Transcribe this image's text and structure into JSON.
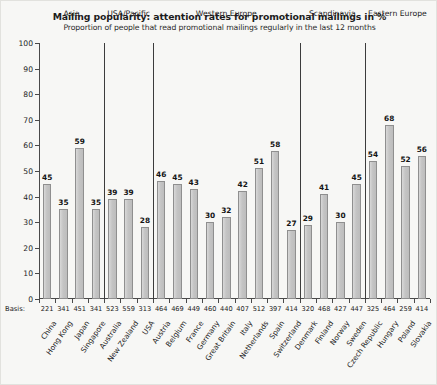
{
  "chart_data": {
    "type": "bar",
    "title": "Mailing popularity: attention rates for promotional mailings in %",
    "subtitle": "Proportion of people that read promotional mailings regularly in the last 12 months",
    "xlabel": "",
    "ylabel": "",
    "ylim": [
      0,
      100
    ],
    "yticks": [
      0,
      10,
      20,
      30,
      40,
      50,
      60,
      70,
      80,
      90,
      100
    ],
    "grid": false,
    "legend": "none",
    "basis_caption": "Basis:",
    "categories": [
      "China",
      "Hong Kong",
      "Japan",
      "Singapore",
      "Australia",
      "New Zealand",
      "USA",
      "Austria",
      "Belgium",
      "France",
      "Germany",
      "Great Britain",
      "Italy",
      "Netherlands",
      "Spain",
      "Switzerland",
      "Denmark",
      "Finland",
      "Norway",
      "Sweden",
      "Czech Republic",
      "Hungary",
      "Poland",
      "Slovakia"
    ],
    "values": [
      45,
      35,
      59,
      35,
      39,
      39,
      28,
      46,
      45,
      43,
      30,
      32,
      42,
      51,
      58,
      27,
      29,
      41,
      30,
      45,
      54,
      68,
      52,
      56
    ],
    "basis": [
      221,
      341,
      451,
      341,
      523,
      559,
      313,
      464,
      469,
      449,
      460,
      440,
      407,
      512,
      397,
      414,
      320,
      468,
      427,
      447,
      325,
      464,
      259,
      414
    ],
    "groups": [
      {
        "label": "Asia",
        "start": 0,
        "end": 3
      },
      {
        "label": "USA/Pacific",
        "start": 4,
        "end": 6
      },
      {
        "label": "Western Europe",
        "start": 7,
        "end": 15
      },
      {
        "label": "Scandinavia",
        "start": 16,
        "end": 19
      },
      {
        "label": "Eastern Europe",
        "start": 20,
        "end": 23
      }
    ],
    "colors": {
      "bar_fill": "#c9c9c9",
      "bar_border": "#8f8f8f",
      "axis": "#4a4a4a",
      "background": "#f7f7f5",
      "text": "#1c1c1c"
    }
  }
}
